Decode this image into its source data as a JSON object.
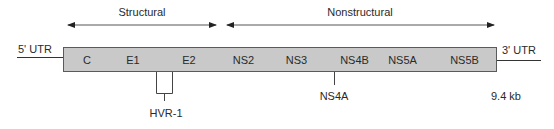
{
  "diagram": {
    "regions": {
      "structural": {
        "label": "Structural",
        "arrow_x1": 68,
        "arrow_x2": 216,
        "label_x": 142
      },
      "nonstructural": {
        "label": "Nonstructural",
        "arrow_x1": 227,
        "arrow_x2": 494,
        "label_x": 360
      }
    },
    "utr5": {
      "label": "5' UTR"
    },
    "utr3": {
      "label": "3' UTR"
    },
    "segments": [
      {
        "name": "C",
        "label": "C",
        "x1": 63,
        "x2": 110
      },
      {
        "name": "E1",
        "label": "E1",
        "x1": 110,
        "x2": 156
      },
      {
        "name": "E2",
        "label": "E2",
        "x1": 156,
        "x2": 222
      },
      {
        "name": "NS2",
        "label": "NS2",
        "x1": 222,
        "x2": 265
      },
      {
        "name": "NS3",
        "label": "NS3",
        "x1": 265,
        "x2": 328
      },
      {
        "name": "NS4A",
        "label": "",
        "x1": 328,
        "x2": 337
      },
      {
        "name": "NS4B",
        "label": "NS4B",
        "x1": 337,
        "x2": 372
      },
      {
        "name": "NS5A",
        "label": "NS5A",
        "x1": 372,
        "x2": 433
      },
      {
        "name": "NS5B",
        "label": "NS5B",
        "x1": 433,
        "x2": 497
      }
    ],
    "callouts": {
      "hvr1": {
        "label": "HVR-1"
      },
      "ns4a": {
        "label": "NS4A"
      }
    },
    "genome_size": "9.4 kb",
    "colors": {
      "segment_fill": "#c9c9c9",
      "segment_border": "#5a5a5a",
      "line": "#333333",
      "text": "#2a2a2a"
    }
  }
}
